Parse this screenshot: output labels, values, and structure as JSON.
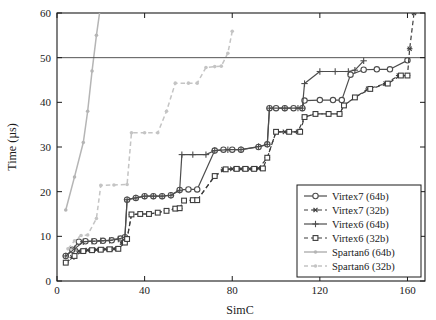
{
  "chart_data": {
    "type": "line",
    "title": "",
    "xlabel": "SimC",
    "ylabel": "Time (µs)",
    "xlim": [
      0,
      168
    ],
    "ylim": [
      0,
      60
    ],
    "xticks": [
      0,
      40,
      80,
      120,
      160
    ],
    "yticks": [
      0,
      10,
      20,
      30,
      40,
      50,
      60
    ],
    "grid": false,
    "legend_position": "lower right",
    "annotations": [
      {
        "type": "hline",
        "y": 50,
        "label": "",
        "color": "#555555"
      }
    ],
    "series": [
      {
        "name": "Virtex7 (64b)",
        "marker": "circle",
        "linestyle": "solid",
        "color": "#4d4d4d",
        "points": [
          [
            4,
            5.6
          ],
          [
            7,
            7.0
          ],
          [
            10,
            8.8
          ],
          [
            13,
            8.9
          ],
          [
            17,
            8.9
          ],
          [
            21,
            9.0
          ],
          [
            25,
            9.1
          ],
          [
            29,
            9.5
          ],
          [
            31,
            9.8
          ],
          [
            32,
            18.2
          ],
          [
            36,
            18.6
          ],
          [
            40,
            19.0
          ],
          [
            44,
            19.0
          ],
          [
            48,
            19.0
          ],
          [
            52,
            19.2
          ],
          [
            56,
            20.4
          ],
          [
            60,
            20.5
          ],
          [
            64,
            20.5
          ],
          [
            72,
            29.2
          ],
          [
            76,
            29.4
          ],
          [
            80,
            29.4
          ],
          [
            84,
            29.4
          ],
          [
            92,
            30.0
          ],
          [
            96,
            30.6
          ],
          [
            97,
            38.7
          ],
          [
            100,
            38.7
          ],
          [
            104,
            38.7
          ],
          [
            108,
            38.7
          ],
          [
            112,
            38.7
          ],
          [
            113,
            40.4
          ],
          [
            120,
            40.5
          ],
          [
            126,
            40.5
          ],
          [
            130,
            40.5
          ],
          [
            134,
            46.2
          ],
          [
            140,
            47.3
          ],
          [
            146,
            47.4
          ],
          [
            152,
            47.4
          ],
          [
            160,
            49.4
          ]
        ]
      },
      {
        "name": "Virtex7 (32b)",
        "marker": "asterisk",
        "linestyle": "dashed",
        "color": "#3d3d3d",
        "points": [
          [
            4,
            4.1
          ],
          [
            7,
            5.3
          ],
          [
            10,
            6.7
          ],
          [
            14,
            6.9
          ],
          [
            18,
            7.0
          ],
          [
            22,
            7.1
          ],
          [
            26,
            7.2
          ],
          [
            30,
            8.6
          ],
          [
            32,
            9.5
          ],
          [
            34,
            14.9
          ],
          [
            38,
            15.0
          ],
          [
            42,
            15.0
          ],
          [
            46,
            15.3
          ],
          [
            50,
            15.8
          ],
          [
            54,
            16.2
          ],
          [
            56,
            16.2
          ],
          [
            58,
            18.0
          ],
          [
            62,
            18.1
          ],
          [
            64,
            18.1
          ],
          [
            72,
            23.5
          ],
          [
            76,
            25.0
          ],
          [
            80,
            25.1
          ],
          [
            84,
            25.1
          ],
          [
            88,
            25.1
          ],
          [
            92,
            25.2
          ],
          [
            96,
            27.6
          ],
          [
            100,
            33.4
          ],
          [
            104,
            33.4
          ],
          [
            110,
            33.4
          ],
          [
            113,
            36.7
          ],
          [
            118,
            37.4
          ],
          [
            124,
            37.4
          ],
          [
            129,
            37.4
          ],
          [
            131,
            39.3
          ],
          [
            136,
            41.1
          ],
          [
            142,
            43.0
          ],
          [
            150,
            44.2
          ],
          [
            156,
            46.0
          ],
          [
            160,
            46.0
          ],
          [
            161,
            52.0
          ],
          [
            163,
            60.0
          ]
        ]
      },
      {
        "name": "Virtex6 (64b)",
        "marker": "plus",
        "linestyle": "solid",
        "color": "#4d4d4d",
        "points": [
          [
            4,
            5.6
          ],
          [
            8,
            7.2
          ],
          [
            12,
            8.8
          ],
          [
            16,
            8.9
          ],
          [
            20,
            9.0
          ],
          [
            24,
            9.1
          ],
          [
            28,
            9.4
          ],
          [
            31,
            9.8
          ],
          [
            32,
            18.2
          ],
          [
            36,
            18.6
          ],
          [
            40,
            19.0
          ],
          [
            44,
            19.0
          ],
          [
            48,
            19.0
          ],
          [
            52,
            19.2
          ],
          [
            56,
            20.3
          ],
          [
            57,
            28.3
          ],
          [
            62,
            28.3
          ],
          [
            68,
            28.3
          ],
          [
            72,
            29.2
          ],
          [
            78,
            29.4
          ],
          [
            84,
            29.4
          ],
          [
            92,
            30.1
          ],
          [
            96,
            30.6
          ],
          [
            97,
            38.7
          ],
          [
            104,
            38.7
          ],
          [
            110,
            38.7
          ],
          [
            112,
            38.7
          ],
          [
            113,
            44.2
          ],
          [
            120,
            46.9
          ],
          [
            127,
            46.9
          ],
          [
            133,
            46.9
          ],
          [
            136,
            47.2
          ],
          [
            140,
            49.3
          ]
        ]
      },
      {
        "name": "Virtex6 (32b)",
        "marker": "square",
        "linestyle": "dashed",
        "color": "#3d3d3d",
        "points": [
          [
            4,
            4.1
          ],
          [
            8,
            5.6
          ],
          [
            12,
            6.7
          ],
          [
            16,
            6.9
          ],
          [
            20,
            7.0
          ],
          [
            24,
            7.1
          ],
          [
            28,
            7.2
          ],
          [
            31,
            8.6
          ],
          [
            32,
            9.4
          ],
          [
            34,
            14.9
          ],
          [
            38,
            15.0
          ],
          [
            42,
            15.0
          ],
          [
            46,
            15.3
          ],
          [
            50,
            15.7
          ],
          [
            54,
            16.2
          ],
          [
            56,
            16.3
          ],
          [
            58,
            18.0
          ],
          [
            62,
            18.1
          ],
          [
            64,
            18.1
          ],
          [
            72,
            23.5
          ],
          [
            77,
            25.0
          ],
          [
            82,
            25.1
          ],
          [
            86,
            25.1
          ],
          [
            90,
            25.1
          ],
          [
            94,
            25.2
          ],
          [
            96,
            27.6
          ],
          [
            100,
            33.4
          ],
          [
            106,
            33.4
          ],
          [
            111,
            33.4
          ],
          [
            113,
            36.7
          ],
          [
            118,
            37.4
          ],
          [
            124,
            37.4
          ],
          [
            129,
            37.4
          ],
          [
            131,
            39.3
          ],
          [
            136,
            41.1
          ],
          [
            143,
            43.0
          ],
          [
            151,
            44.2
          ],
          [
            157,
            46.0
          ],
          [
            160,
            46.0
          ]
        ]
      },
      {
        "name": "Spartan6 (64b)",
        "marker": "dot",
        "linestyle": "solid",
        "color": "#b5b5b5",
        "points": [
          [
            4,
            15.9
          ],
          [
            8,
            23.3
          ],
          [
            12,
            31.0
          ],
          [
            14,
            38.0
          ],
          [
            16,
            47.0
          ],
          [
            18,
            55.0
          ],
          [
            20,
            62.0
          ]
        ]
      },
      {
        "name": "Spartan6 (32b)",
        "marker": "dot",
        "linestyle": "dashed",
        "color": "#c4c4c4",
        "points": [
          [
            5,
            7.2
          ],
          [
            8,
            9.0
          ],
          [
            11,
            10.2
          ],
          [
            14,
            10.3
          ],
          [
            18,
            14.0
          ],
          [
            20,
            21.4
          ],
          [
            26,
            21.5
          ],
          [
            32,
            21.6
          ],
          [
            34,
            33.2
          ],
          [
            40,
            33.2
          ],
          [
            46,
            33.2
          ],
          [
            50,
            38.0
          ],
          [
            54,
            44.3
          ],
          [
            60,
            44.3
          ],
          [
            64,
            44.3
          ],
          [
            68,
            47.8
          ],
          [
            72,
            48.0
          ],
          [
            75,
            48.1
          ],
          [
            78,
            51.0
          ],
          [
            80,
            55.9
          ]
        ]
      }
    ]
  },
  "legend": {
    "items": [
      {
        "label": "Virtex7 (64b)"
      },
      {
        "label": "Virtex7 (32b)"
      },
      {
        "label": "Virtex6 (64b)"
      },
      {
        "label": "Virtex6 (32b)"
      },
      {
        "label": "Spartan6 (64b)"
      },
      {
        "label": "Spartan6 (32b)"
      }
    ]
  }
}
